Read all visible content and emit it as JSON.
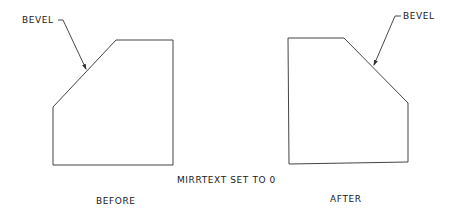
{
  "diagram": {
    "caption": "MIRRTEXT SET TO 0",
    "stroke_color": "#444444",
    "text_color": "#1a1a1a",
    "before": {
      "label": "BEFORE",
      "callout": "BEVEL",
      "shape_points": "116,40 173,40 173,165 53,165 53,107",
      "leader_points": "58,20 63,20 86,69"
    },
    "after": {
      "label": "AFTER",
      "callout": "BEVEL",
      "shape_points": "288,38 344,38 408,103 408,162 289,164",
      "leader_points": "401,16 395,16 374,65"
    }
  }
}
